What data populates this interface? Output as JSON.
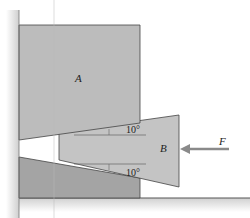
{
  "diagram": {
    "labels": {
      "block_a": "A",
      "wedge_b": "B",
      "force": "F",
      "angle_top": "10°",
      "angle_bottom": "10°"
    },
    "colors": {
      "block_a": "#bcbcbc",
      "wedge_b": "#c4c4c4",
      "lower_block": "#a4a4a4",
      "wall": "#d8d8d8",
      "arrow": "#8a8a8a",
      "outline": "#444444"
    }
  }
}
